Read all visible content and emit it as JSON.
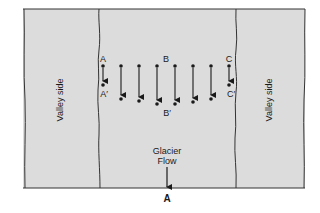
{
  "diagram": {
    "colors": {
      "fill": "#dcdcdc",
      "line": "#333333",
      "text": "#1a1a1a",
      "background": "#ffffff"
    },
    "labels": {
      "valley_side_left": "Valley side",
      "valley_side_right": "Valley side",
      "point_a": "A",
      "point_a_prime": "A′",
      "point_b": "B",
      "point_b_prime": "B′",
      "point_c": "C",
      "point_c_prime": "C′",
      "flow_line1": "Glacier",
      "flow_line2": "Flow",
      "section_label": "A"
    },
    "markers": [
      {
        "x": 103,
        "y0": 66,
        "y1": 85
      },
      {
        "x": 121,
        "y0": 66,
        "y1": 99
      },
      {
        "x": 139,
        "y0": 66,
        "y1": 101
      },
      {
        "x": 157,
        "y0": 66,
        "y1": 104
      },
      {
        "x": 175,
        "y0": 66,
        "y1": 104
      },
      {
        "x": 193,
        "y0": 66,
        "y1": 102
      },
      {
        "x": 211,
        "y0": 66,
        "y1": 99
      },
      {
        "x": 229,
        "y0": 66,
        "y1": 85
      }
    ]
  }
}
